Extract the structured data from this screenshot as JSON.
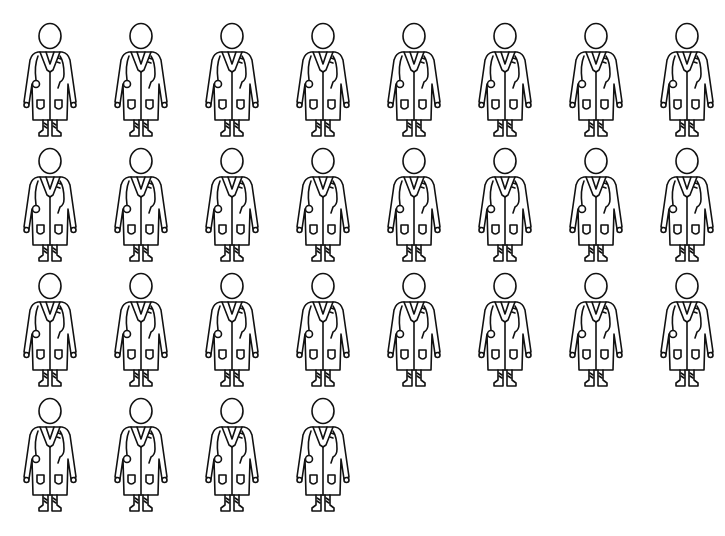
{
  "title": {
    "text": "",
    "note_visible": "cropped title text; only descender fragments visible"
  },
  "icon": "doctor-in-lab-coat-with-stethoscope",
  "grid": {
    "columns": 8,
    "rows": [
      {
        "count": 8
      },
      {
        "count": 8
      },
      {
        "count": 8
      },
      {
        "count": 4
      }
    ],
    "total_figures": 28
  },
  "colors": {
    "line": "#111111",
    "background": "#ffffff"
  }
}
